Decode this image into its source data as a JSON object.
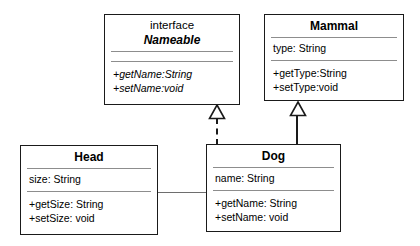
{
  "diagram": {
    "type": "uml-class-diagram",
    "background": "#ffffff",
    "line_color": "#1a1a1a",
    "separator_color": "#8d8d8d",
    "classes": [
      {
        "id": "nameable",
        "stereotype": "interface",
        "name": "Nameable",
        "is_abstract": true,
        "attributes": [],
        "operations": [
          "+getName:String",
          "+setName:void"
        ],
        "operations_italic": true
      },
      {
        "id": "mammal",
        "stereotype": "",
        "name": "Mammal",
        "is_abstract": false,
        "attributes": [
          "type: String"
        ],
        "operations": [
          "+getType:String",
          "+setType:void"
        ],
        "operations_italic": false
      },
      {
        "id": "head",
        "stereotype": "",
        "name": "Head",
        "is_abstract": false,
        "attributes": [
          "size: String"
        ],
        "operations": [
          "+getSize: String",
          "+setSize: void"
        ],
        "operations_italic": false
      },
      {
        "id": "dog",
        "stereotype": "",
        "name": "Dog",
        "is_abstract": false,
        "attributes": [
          "name: String"
        ],
        "operations": [
          "+getName: String",
          "+setName: void"
        ],
        "operations_italic": false
      }
    ],
    "relationships": [
      {
        "id": "dog-realizes-nameable",
        "kind": "realization",
        "style": "dashed",
        "arrow": "hollow-triangle",
        "from": "Dog",
        "to": "Nameable"
      },
      {
        "id": "dog-extends-mammal",
        "kind": "generalization",
        "style": "solid",
        "arrow": "hollow-triangle",
        "from": "Dog",
        "to": "Mammal"
      },
      {
        "id": "head-dog-association",
        "kind": "association",
        "style": "solid",
        "arrow": "none",
        "from": "Head",
        "to": "Dog"
      }
    ]
  }
}
